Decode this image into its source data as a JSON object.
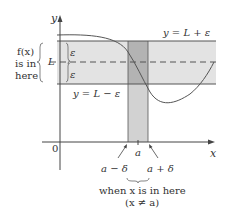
{
  "diagram": {
    "axes": {
      "y_label": "y",
      "x_label": "x",
      "origin_label": "0"
    },
    "band": {
      "upper_label": "y = L + ε",
      "lower_label": "y = L − ε",
      "center_label": "L",
      "epsilon_upper": "ε",
      "epsilon_lower": "ε"
    },
    "left_annotation": {
      "line1": "f(x)",
      "line2": "is in",
      "line3": "here"
    },
    "x_markers": {
      "a": "a",
      "a_minus_delta": "a − δ",
      "a_plus_delta": "a + δ"
    },
    "bottom_annotation": {
      "line1": "when x is in here",
      "line2": "(x ≠ a)"
    },
    "colors": {
      "band_fill": "#e3e3e3",
      "strip_fill": "#d2d2d2",
      "overlap_fill": "#b3b3b3",
      "line": "#555555",
      "axis": "#444444"
    }
  }
}
